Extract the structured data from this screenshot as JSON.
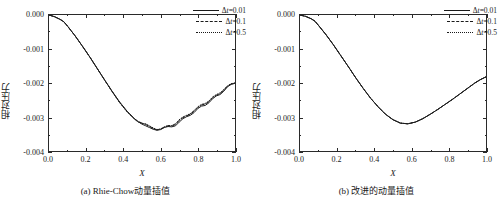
{
  "figure": {
    "panels": [
      {
        "id": "a",
        "caption": "(a) Rhie-Chow动量插值",
        "xlabel": "X",
        "ylabel": "相对压力",
        "ytick_labels": [
          "0.000",
          "-0.001",
          "-0.002",
          "-0.003",
          "-0.004"
        ],
        "xtick_labels": [
          "0.0",
          "0.2",
          "0.4",
          "0.6",
          "0.8",
          "1.0"
        ],
        "legend": [
          {
            "label": "Δt=0.01",
            "style": "solid"
          },
          {
            "label": "Δt=0.1",
            "style": "dashed"
          },
          {
            "label": "Δt=0.5",
            "style": "dotted"
          }
        ]
      },
      {
        "id": "b",
        "caption": "(b) 改进的动量插值",
        "xlabel": "X",
        "ylabel": "相对压力",
        "ytick_labels": [
          "0.000",
          "-0.001",
          "-0.002",
          "-0.003",
          "-0.004"
        ],
        "xtick_labels": [
          "0.0",
          "0.2",
          "0.4",
          "0.6",
          "0.8",
          "1.0"
        ],
        "legend": [
          {
            "label": "Δt=0.01",
            "style": "solid"
          },
          {
            "label": "Δt=0.1",
            "style": "dashed"
          },
          {
            "label": "Δt=0.5",
            "style": "dotted"
          }
        ]
      }
    ],
    "line_color": "#1a1a1a",
    "axis_color": "#2a2a2a"
  },
  "chart_data": [
    {
      "type": "line",
      "title": "(a) Rhie-Chow动量插值",
      "xlabel": "X",
      "ylabel": "相对压力",
      "xlim": [
        0.0,
        1.0
      ],
      "ylim": [
        -0.004,
        0.0
      ],
      "xticks": [
        0.0,
        0.2,
        0.4,
        0.6,
        0.8,
        1.0
      ],
      "yticks": [
        0.0,
        -0.001,
        -0.002,
        -0.003,
        -0.004
      ],
      "grid": false,
      "legend_position": "upper-right",
      "x": [
        0.0,
        0.03,
        0.06,
        0.08,
        0.1,
        0.14,
        0.18,
        0.22,
        0.26,
        0.3,
        0.34,
        0.38,
        0.42,
        0.46,
        0.48,
        0.5,
        0.52,
        0.54,
        0.56,
        0.58,
        0.6,
        0.62,
        0.64,
        0.66,
        0.68,
        0.7,
        0.72,
        0.74,
        0.76,
        0.78,
        0.8,
        0.82,
        0.84,
        0.86,
        0.88,
        0.9,
        0.92,
        0.94,
        0.96,
        0.98,
        1.0
      ],
      "series": [
        {
          "name": "Δt=0.01",
          "style": "solid",
          "values": [
            0.0,
            -5e-05,
            -0.00013,
            -0.0002,
            -0.00033,
            -0.00061,
            -0.00092,
            -0.00124,
            -0.00158,
            -0.00192,
            -0.00225,
            -0.00256,
            -0.00283,
            -0.00305,
            -0.00314,
            -0.00321,
            -0.00326,
            -0.00331,
            -0.00336,
            -0.00339,
            -0.00337,
            -0.00331,
            -0.00328,
            -0.00329,
            -0.00326,
            -0.00315,
            -0.00305,
            -0.00299,
            -0.00295,
            -0.00287,
            -0.00275,
            -0.00268,
            -0.00266,
            -0.00258,
            -0.00246,
            -0.00238,
            -0.00234,
            -0.00224,
            -0.00211,
            -0.00204,
            -0.00201
          ]
        },
        {
          "name": "Δt=0.1",
          "style": "dashed",
          "values": [
            0.0,
            -5e-05,
            -0.00013,
            -0.0002,
            -0.00033,
            -0.00061,
            -0.00092,
            -0.00124,
            -0.00158,
            -0.00192,
            -0.00225,
            -0.00257,
            -0.00284,
            -0.00306,
            -0.00313,
            -0.00318,
            -0.00322,
            -0.00328,
            -0.00334,
            -0.00338,
            -0.00336,
            -0.0033,
            -0.00326,
            -0.00327,
            -0.00322,
            -0.0031,
            -0.00302,
            -0.00297,
            -0.00292,
            -0.00283,
            -0.00272,
            -0.00265,
            -0.00262,
            -0.00255,
            -0.00243,
            -0.00236,
            -0.00231,
            -0.00221,
            -0.00209,
            -0.00203,
            -0.002
          ]
        },
        {
          "name": "Δt=0.5",
          "style": "dotted",
          "values": [
            0.0,
            -5e-05,
            -0.00013,
            -0.0002,
            -0.00033,
            -0.00061,
            -0.00092,
            -0.00124,
            -0.00158,
            -0.00192,
            -0.00226,
            -0.00258,
            -0.00285,
            -0.00307,
            -0.00315,
            -0.00319,
            -0.0032,
            -0.00326,
            -0.00332,
            -0.00337,
            -0.00335,
            -0.00329,
            -0.00325,
            -0.00325,
            -0.0032,
            -0.00308,
            -0.003,
            -0.00295,
            -0.0029,
            -0.00281,
            -0.0027,
            -0.00263,
            -0.0026,
            -0.00253,
            -0.00241,
            -0.00234,
            -0.00229,
            -0.00219,
            -0.00208,
            -0.00202,
            -0.002
          ]
        }
      ]
    },
    {
      "type": "line",
      "title": "(b) 改进的动量插值",
      "xlabel": "X",
      "ylabel": "相对压力",
      "xlim": [
        0.0,
        1.0
      ],
      "ylim": [
        -0.004,
        0.0
      ],
      "xticks": [
        0.0,
        0.2,
        0.4,
        0.6,
        0.8,
        1.0
      ],
      "yticks": [
        0.0,
        -0.001,
        -0.002,
        -0.003,
        -0.004
      ],
      "grid": false,
      "legend_position": "upper-right",
      "x": [
        0.0,
        0.03,
        0.06,
        0.08,
        0.1,
        0.14,
        0.18,
        0.22,
        0.26,
        0.3,
        0.34,
        0.38,
        0.42,
        0.46,
        0.5,
        0.54,
        0.58,
        0.62,
        0.66,
        0.7,
        0.74,
        0.78,
        0.82,
        0.86,
        0.9,
        0.94,
        0.97,
        1.0
      ],
      "series": [
        {
          "name": "Δt=0.01",
          "style": "solid",
          "values": [
            0.0,
            -4e-05,
            -0.00011,
            -0.00018,
            -0.00031,
            -0.00058,
            -0.00088,
            -0.0012,
            -0.00152,
            -0.00185,
            -0.00216,
            -0.00245,
            -0.0027,
            -0.00292,
            -0.00308,
            -0.00318,
            -0.0032,
            -0.00315,
            -0.00305,
            -0.00292,
            -0.00278,
            -0.00263,
            -0.00248,
            -0.00232,
            -0.00216,
            -0.002,
            -0.0019,
            -0.00182
          ]
        },
        {
          "name": "Δt=0.1",
          "style": "dashed",
          "values": [
            0.0,
            -4e-05,
            -0.00011,
            -0.00018,
            -0.00031,
            -0.00058,
            -0.00088,
            -0.0012,
            -0.00152,
            -0.00185,
            -0.00216,
            -0.00245,
            -0.0027,
            -0.00292,
            -0.00308,
            -0.00318,
            -0.0032,
            -0.00315,
            -0.00305,
            -0.00292,
            -0.00278,
            -0.00263,
            -0.00248,
            -0.00232,
            -0.00216,
            -0.002,
            -0.0019,
            -0.00182
          ]
        },
        {
          "name": "Δt=0.5",
          "style": "dotted",
          "values": [
            0.0,
            -4e-05,
            -0.00011,
            -0.00018,
            -0.00031,
            -0.00058,
            -0.00088,
            -0.0012,
            -0.00152,
            -0.00185,
            -0.00216,
            -0.00245,
            -0.0027,
            -0.00292,
            -0.00308,
            -0.00318,
            -0.0032,
            -0.00315,
            -0.00305,
            -0.00292,
            -0.00278,
            -0.00263,
            -0.00248,
            -0.00232,
            -0.00216,
            -0.002,
            -0.0019,
            -0.00182
          ]
        }
      ]
    }
  ]
}
